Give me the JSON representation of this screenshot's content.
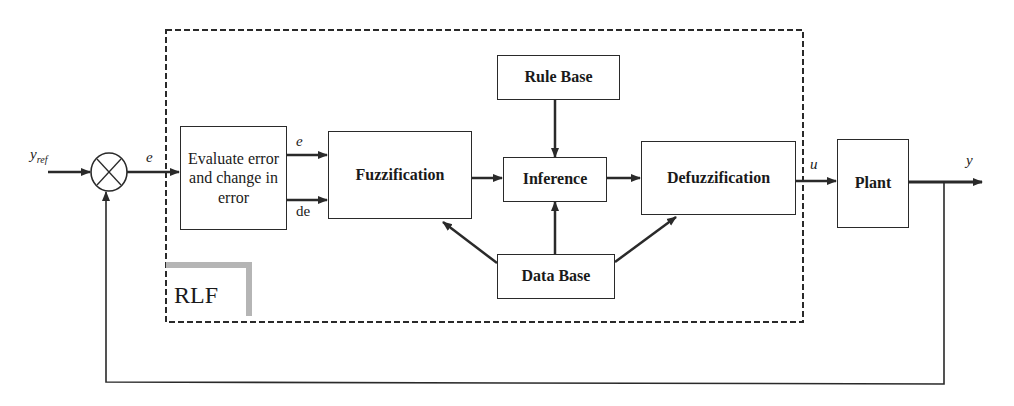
{
  "diagram": {
    "type": "block-diagram",
    "container_label": "RLF",
    "signals": {
      "reference": "y_ref",
      "error": "e",
      "error_out": "e",
      "change_in_error": "de",
      "control": "u",
      "output": "y"
    },
    "blocks": [
      {
        "id": "summing_junction",
        "label": "⊗"
      },
      {
        "id": "evaluate",
        "label": "Evaluate error and change in error"
      },
      {
        "id": "fuzzification",
        "label": "Fuzzification"
      },
      {
        "id": "rule_base",
        "label": "Rule Base"
      },
      {
        "id": "inference",
        "label": "Inference"
      },
      {
        "id": "data_base",
        "label": "Data Base"
      },
      {
        "id": "defuzzification",
        "label": "Defuzzification"
      },
      {
        "id": "plant",
        "label": "Plant"
      }
    ],
    "edges": [
      {
        "from": "y_ref",
        "to": "summing_junction"
      },
      {
        "from": "summing_junction",
        "to": "evaluate",
        "label": "e"
      },
      {
        "from": "evaluate",
        "to": "fuzzification",
        "label": "e"
      },
      {
        "from": "evaluate",
        "to": "fuzzification",
        "label": "de"
      },
      {
        "from": "fuzzification",
        "to": "inference"
      },
      {
        "from": "rule_base",
        "to": "inference"
      },
      {
        "from": "data_base",
        "to": "inference"
      },
      {
        "from": "data_base",
        "to": "fuzzification"
      },
      {
        "from": "data_base",
        "to": "defuzzification"
      },
      {
        "from": "inference",
        "to": "defuzzification"
      },
      {
        "from": "defuzzification",
        "to": "plant",
        "label": "u"
      },
      {
        "from": "plant",
        "to": "y",
        "label": "y"
      },
      {
        "from": "y",
        "to": "summing_junction",
        "label": "feedback"
      }
    ]
  },
  "labels": {
    "yref_main": "y",
    "yref_sub": "ref",
    "e_in": "e",
    "e_out": "e",
    "de": "de",
    "u": "u",
    "y": "y",
    "rlf": "RLF"
  },
  "boxes": {
    "evaluate": "Evaluate error and change in error",
    "fuzzification": "Fuzzification",
    "rule_base": "Rule Base",
    "inference": "Inference",
    "data_base": "Data Base",
    "defuzzification": "Defuzzification",
    "plant": "Plant"
  }
}
